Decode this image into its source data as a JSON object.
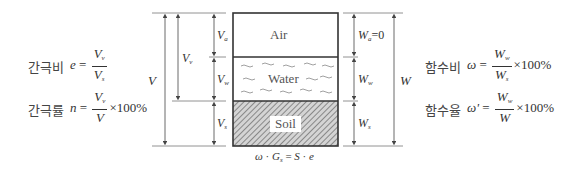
{
  "diagram": {
    "phases": [
      {
        "name": "Air",
        "volume_label": "V",
        "volume_sub": "a",
        "weight_label": "W",
        "weight_sub": "a",
        "weight_suffix": "=0"
      },
      {
        "name": "Water",
        "volume_label": "V",
        "volume_sub": "w",
        "weight_label": "W",
        "weight_sub": "w",
        "weight_suffix": ""
      },
      {
        "name": "Soil",
        "volume_label": "V",
        "volume_sub": "s",
        "weight_label": "W",
        "weight_sub": "s",
        "weight_suffix": ""
      }
    ],
    "void_volume": {
      "label": "V",
      "sub": "v"
    },
    "total_volume": {
      "label": "V"
    },
    "total_weight": {
      "label": "W"
    },
    "relation": {
      "text_parts": [
        "ω",
        " · ",
        "G",
        "s",
        " = ",
        "S",
        " · ",
        "e"
      ]
    }
  },
  "formulas_left": [
    {
      "name_kr": "간극비",
      "symbol": "e",
      "eq": "=",
      "num": "V",
      "num_sub": "v",
      "den": "V",
      "den_sub": "s",
      "suffix": ""
    },
    {
      "name_kr": "간극률",
      "symbol": "n",
      "eq": "=",
      "num": "V",
      "num_sub": "v",
      "den": "V",
      "den_sub": "",
      "suffix": "×100%"
    }
  ],
  "formulas_right": [
    {
      "name_kr": "함수비",
      "symbol": "ω",
      "eq": "=",
      "num": "W",
      "num_sub": "w",
      "den": "W",
      "den_sub": "s",
      "suffix": "×100%"
    },
    {
      "name_kr": "함수율",
      "symbol": "ω'",
      "eq": "=",
      "num": "W",
      "num_sub": "w",
      "den": "W",
      "den_sub": "",
      "suffix": "×100%"
    }
  ],
  "colors": {
    "line": "#555555",
    "box": "#333333",
    "hatch_bg": "#d8d8d8",
    "hatch": "#555555",
    "wave": "#888888"
  }
}
